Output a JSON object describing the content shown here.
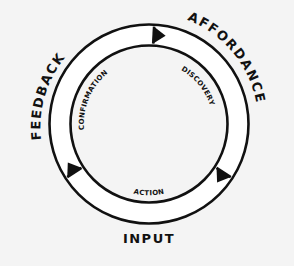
{
  "diagram": {
    "type": "cycle",
    "direction": "clockwise",
    "stages": [
      {
        "outer_label": "FEEDBACK",
        "inner_label": "CONFIRMATION"
      },
      {
        "outer_label": "AFFORDANCE",
        "inner_label": "DISCOVERY"
      },
      {
        "outer_label": "INPUT",
        "inner_label": "ACTION"
      }
    ],
    "arrow_count": 3,
    "colors": {
      "background": "#f4f4f4",
      "ring_fill": "#ffffff",
      "stroke": "#111111",
      "text": "#111111"
    }
  }
}
